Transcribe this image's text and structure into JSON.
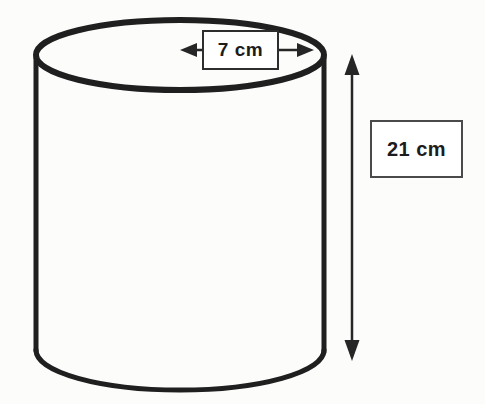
{
  "diagram": {
    "shape": "cylinder",
    "radius_label": "7 cm",
    "height_label": "21 cm",
    "colors": {
      "outline_stroke": "#1f1f1f",
      "dimension_line": "#262626",
      "label_border": "#3a3a3a",
      "label_background": "#ffffff",
      "label_text": "#1c1c1c",
      "background": "#fcfcfb"
    }
  }
}
